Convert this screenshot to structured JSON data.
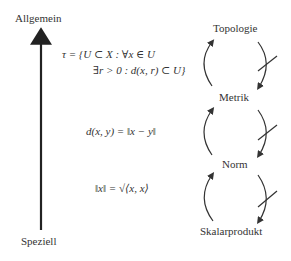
{
  "axis": {
    "top_label": "Allgemein",
    "bottom_label": "Speziell"
  },
  "structures": [
    {
      "name": "Topologie"
    },
    {
      "name": "Metrik"
    },
    {
      "name": "Norm"
    },
    {
      "name": "Skalarprodukt"
    }
  ],
  "formulas": {
    "topology_line1": "τ = {U ⊂ X : ∀x ∈ U",
    "topology_line2": "∃r > 0 : d(x, r) ⊂ U}",
    "metric": "d(x, y) = ‖x − y‖",
    "norm": "‖x‖ = √⟨x, x⟩"
  },
  "colors": {
    "stroke": "#333333",
    "text": "#333333",
    "background": "#ffffff"
  }
}
